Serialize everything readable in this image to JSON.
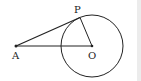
{
  "diagram": {
    "type": "geometry",
    "points": {
      "A": {
        "label": "A",
        "x": 16,
        "y": 46
      },
      "O": {
        "label": "O",
        "x": 92,
        "y": 46
      },
      "P": {
        "label": "P",
        "x": 80,
        "y": 18
      }
    },
    "circle": {
      "center": "O",
      "radius": 31
    },
    "segments": [
      [
        "A",
        "P"
      ],
      [
        "A",
        "O"
      ],
      [
        "O",
        "P"
      ]
    ],
    "colors": {
      "stroke": "#222222",
      "background": "#ffffff",
      "side_strip": "#ececec"
    }
  }
}
